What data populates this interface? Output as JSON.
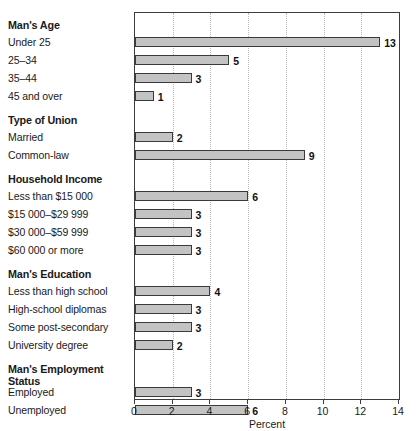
{
  "chart_data": {
    "type": "bar",
    "orientation": "horizontal",
    "title": "",
    "xlabel": "Percent",
    "ylabel": "",
    "xlim": [
      0,
      14
    ],
    "xticks": [
      0,
      2,
      4,
      6,
      8,
      10,
      12,
      14
    ],
    "xtick_labels": [
      "0",
      "2",
      "4",
      "6",
      "8",
      "10",
      "12",
      "14"
    ],
    "grid": "vertical-dotted",
    "legend": "none",
    "bar_color": "#c3c3c3",
    "bar_edge_color": "#3a3a3a",
    "groups": [
      {
        "title": "Man's Age",
        "categories": [
          "Under 25",
          "25–34",
          "35–44",
          "45 and over"
        ],
        "values": [
          13,
          5,
          3,
          1
        ]
      },
      {
        "title": "Type of Union",
        "categories": [
          "Married",
          "Common-law"
        ],
        "values": [
          2,
          9
        ]
      },
      {
        "title": "Household Income",
        "categories": [
          "Less than $15 000",
          "$15 000–$29 999",
          "$30 000–$59 999",
          "$60 000 or more"
        ],
        "values": [
          6,
          3,
          3,
          3
        ]
      },
      {
        "title": "Man's Education",
        "categories": [
          "Less than high school",
          "High-school diplomas",
          "Some post-secondary",
          "University degree"
        ],
        "values": [
          4,
          3,
          3,
          2
        ]
      },
      {
        "title": "Man's Employment Status",
        "title_lines": [
          "Man's Employment",
          "Status"
        ],
        "categories": [
          "Employed",
          "Unemployed"
        ],
        "values": [
          3,
          6
        ]
      }
    ]
  }
}
